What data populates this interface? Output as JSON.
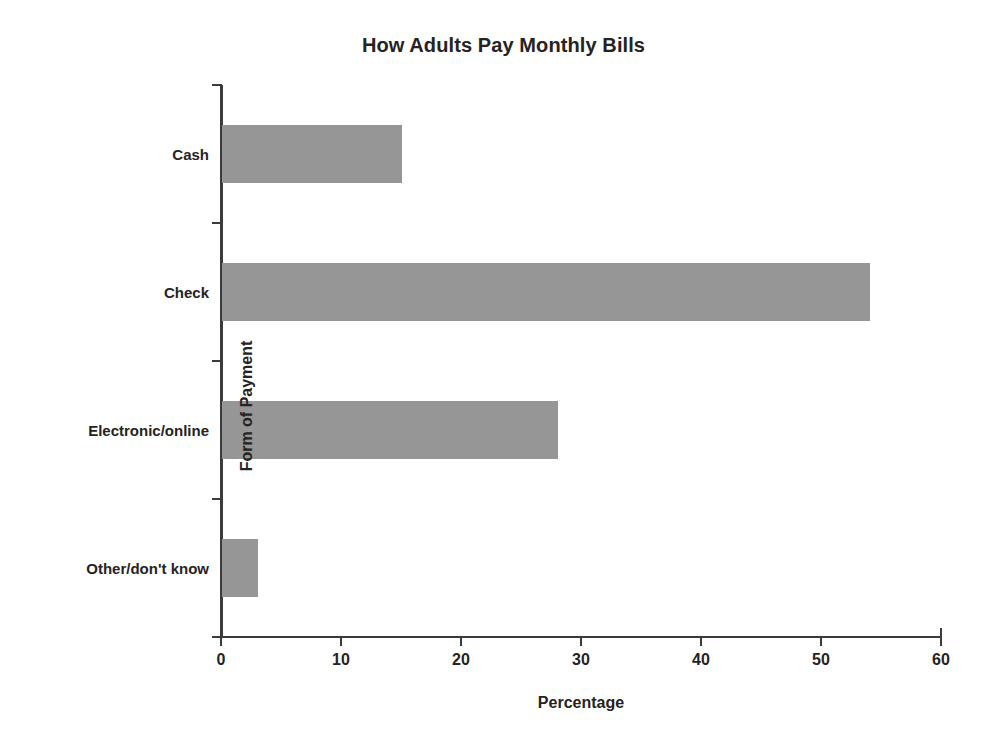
{
  "chart_data": {
    "type": "bar",
    "orientation": "horizontal",
    "title": "How Adults Pay Monthly Bills",
    "xlabel": "Percentage",
    "ylabel": "Form of Payment",
    "categories": [
      "Cash",
      "Check",
      "Electronic/online",
      "Other/don't know"
    ],
    "values": [
      15,
      54,
      28,
      3
    ],
    "xlim": [
      0,
      60
    ],
    "xticks": [
      0,
      10,
      20,
      30,
      40,
      50,
      60
    ],
    "xtick_labels": [
      "0",
      "10",
      "20",
      "30",
      "40",
      "50",
      "60"
    ],
    "grid": false,
    "legend": false,
    "bar_color": "#969696",
    "axis_color": "#3b3b3b",
    "text_color": "#262322",
    "background": "#ffffff"
  }
}
